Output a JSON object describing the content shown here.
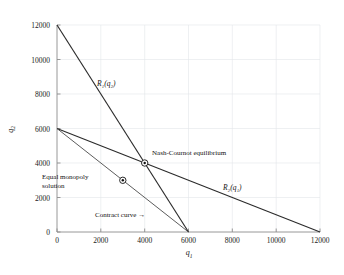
{
  "chart_data": {
    "type": "line",
    "title": "",
    "xlabel": "q1",
    "ylabel": "q2",
    "xlim": [
      0,
      12800
    ],
    "ylim": [
      0,
      12800
    ],
    "xticks": [
      0,
      2000,
      4000,
      6000,
      8000,
      10000,
      12000
    ],
    "yticks": [
      0,
      2000,
      4000,
      6000,
      8000,
      10000,
      12000
    ],
    "xtick_labels": [
      "0",
      "2000",
      "4000",
      "6000",
      "8000",
      "10000",
      "12000"
    ],
    "ytick_labels": [
      "0",
      "2000",
      "4000",
      "6000",
      "8000",
      "10000",
      "12000"
    ],
    "grid": true,
    "legend": "none",
    "series": [
      {
        "name": "R1(q2)",
        "label": "R₁(q₂)",
        "description": "reaction function of firm 1",
        "x": [
          0,
          6000
        ],
        "y": [
          12000,
          0
        ],
        "color": "#2b2b2b"
      },
      {
        "name": "R2(q1)",
        "label": "R₂(q₁)",
        "description": "reaction function of firm 2",
        "x": [
          0,
          12000
        ],
        "y": [
          6000,
          0
        ],
        "color": "#2b2b2b"
      },
      {
        "name": "contract-curve",
        "label": "Contract curve →",
        "description": "locus of equal monopoly / efficient outputs",
        "x": [
          0,
          6000
        ],
        "y": [
          6000,
          0
        ],
        "color": "#4a4a4a"
      }
    ],
    "points": [
      {
        "name": "nash-cournot-equilibrium",
        "label": "Nash-Cournot equilibrium",
        "x": 4000,
        "y": 4000,
        "marker": "circle-dot"
      },
      {
        "name": "equal-monopoly-solution",
        "label": "Equal monopoly solution",
        "x": 3000,
        "y": 3000,
        "marker": "circle-dot"
      }
    ],
    "annotations": [
      {
        "name": "nash-cournot-label",
        "text": "Nash-Cournot equilibrium"
      },
      {
        "name": "equal-monopoly-label",
        "text": "Equal monopoly solution"
      },
      {
        "name": "contract-curve-label",
        "text": "Contract curve →"
      },
      {
        "name": "r1-label",
        "text": "R₁(q₂)"
      },
      {
        "name": "r2-label",
        "text": "R₂(q₁)"
      }
    ],
    "colors": {
      "line": "#2b2b2b",
      "grid": "#dfe3e8",
      "axis": "#9a9a9a",
      "text": "#111111",
      "background": "#ffffff"
    }
  }
}
